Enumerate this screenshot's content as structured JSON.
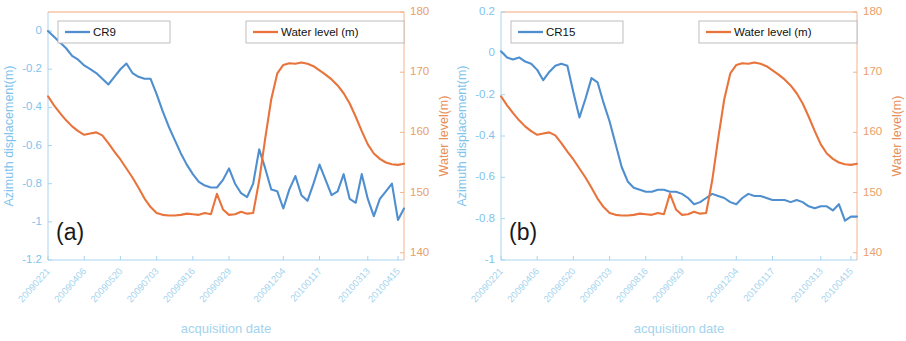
{
  "figure": {
    "width": 906,
    "height": 341,
    "background": "#ffffff",
    "panels": [
      "a",
      "b"
    ]
  },
  "colors": {
    "blue_series": "#4f8fd0",
    "orange_series": "#e8743c",
    "left_axis": "#7fc3ec",
    "right_axis": "#e8905a",
    "xtick": "#a3d3ee",
    "legend_border": "#b7b7b7",
    "panel_tag": "#1a1a1a"
  },
  "chart_data": [
    {
      "type": "line",
      "panel": "a",
      "panel_tag": "(a)",
      "title": "",
      "xlabel": "acquisition date",
      "ylabel": "Azimuth displacement(m)",
      "y2label": "Water level(m)",
      "grid": false,
      "legend_position": "top, two boxes",
      "ylim": [
        -1.2,
        0.1
      ],
      "y2lim": [
        138.8,
        180
      ],
      "yticks": [
        "0",
        "-0.2",
        "-0.4",
        "-0.6",
        "-0.8",
        "-1",
        "-1.2"
      ],
      "ytick_values": [
        0,
        -0.2,
        -0.4,
        -0.6,
        -0.8,
        -1,
        -1.2
      ],
      "y2ticks": [
        "180",
        "170",
        "160",
        "150",
        "140"
      ],
      "y2tick_values": [
        180,
        170,
        160,
        150,
        140
      ],
      "xticks": [
        "20090221",
        "20090406",
        "20090520",
        "20090703",
        "20090816",
        "20090929",
        "20091204",
        "20100117",
        "20100313",
        "20100415"
      ],
      "xtick_positions": [
        0,
        6,
        12,
        18,
        24,
        30,
        39,
        45,
        53,
        58
      ],
      "n_points": 60,
      "series": [
        {
          "name": "CR9",
          "color": "#4f8fd0",
          "axis": "left",
          "values": [
            0.0,
            -0.03,
            -0.06,
            -0.09,
            -0.13,
            -0.15,
            -0.18,
            -0.2,
            -0.22,
            -0.25,
            -0.28,
            -0.24,
            -0.2,
            -0.17,
            -0.22,
            -0.24,
            -0.25,
            -0.25,
            -0.33,
            -0.42,
            -0.5,
            -0.57,
            -0.64,
            -0.7,
            -0.75,
            -0.79,
            -0.81,
            -0.82,
            -0.82,
            -0.78,
            -0.72,
            -0.8,
            -0.85,
            -0.87,
            -0.8,
            -0.62,
            -0.72,
            -0.83,
            -0.84,
            -0.93,
            -0.83,
            -0.76,
            -0.86,
            -0.89,
            -0.8,
            -0.7,
            -0.78,
            -0.86,
            -0.84,
            -0.75,
            -0.88,
            -0.9,
            -0.75,
            -0.88,
            -0.97,
            -0.88,
            -0.84,
            -0.8,
            -0.99,
            -0.93
          ]
        },
        {
          "name": "Water level (m)",
          "color": "#e8743c",
          "axis": "right",
          "values": [
            166.0,
            164.5,
            163.2,
            162.0,
            161.0,
            160.2,
            159.6,
            159.8,
            160.0,
            159.5,
            158.2,
            156.8,
            155.5,
            154.0,
            152.5,
            150.8,
            149.0,
            147.6,
            146.6,
            146.3,
            146.2,
            146.2,
            146.3,
            146.5,
            146.4,
            146.3,
            146.6,
            146.4,
            149.8,
            147.2,
            146.3,
            146.4,
            146.8,
            146.5,
            146.6,
            152.0,
            159.0,
            165.5,
            169.8,
            171.2,
            171.5,
            171.4,
            171.6,
            171.4,
            171.0,
            170.3,
            169.6,
            168.8,
            167.8,
            166.5,
            164.8,
            162.6,
            160.2,
            158.0,
            156.5,
            155.6,
            155.0,
            154.7,
            154.6,
            154.8
          ]
        }
      ],
      "legends": [
        {
          "label": "CR9",
          "color": "#4f8fd0"
        },
        {
          "label": "Water level (m)",
          "color": "#e8743c"
        }
      ]
    },
    {
      "type": "line",
      "panel": "b",
      "panel_tag": "(b)",
      "title": "",
      "xlabel": "acquisition date",
      "ylabel": "Azimuth displacement(m)",
      "y2label": "Water level(m)",
      "grid": false,
      "legend_position": "top, two boxes",
      "ylim": [
        -1.0,
        0.2
      ],
      "y2lim": [
        138.8,
        180
      ],
      "yticks": [
        "0.2",
        "0",
        "-0.2",
        "-0.4",
        "-0.6",
        "-0.8",
        "-1"
      ],
      "ytick_values": [
        0.2,
        0,
        -0.2,
        -0.4,
        -0.6,
        -0.8,
        -1
      ],
      "y2ticks": [
        "180",
        "170",
        "160",
        "150",
        "140"
      ],
      "y2tick_values": [
        180,
        170,
        160,
        150,
        140
      ],
      "xticks": [
        "20090221",
        "20090406",
        "20090520",
        "20090703",
        "20090816",
        "20090929",
        "20091204",
        "20100117",
        "20100313",
        "20100415"
      ],
      "xtick_positions": [
        0,
        6,
        12,
        18,
        24,
        30,
        39,
        45,
        53,
        58
      ],
      "n_points": 60,
      "series": [
        {
          "name": "CR15",
          "color": "#4f8fd0",
          "axis": "left",
          "values": [
            0.01,
            -0.02,
            -0.03,
            -0.02,
            -0.04,
            -0.05,
            -0.08,
            -0.13,
            -0.09,
            -0.06,
            -0.05,
            -0.06,
            -0.19,
            -0.31,
            -0.22,
            -0.12,
            -0.14,
            -0.24,
            -0.33,
            -0.44,
            -0.55,
            -0.62,
            -0.65,
            -0.66,
            -0.67,
            -0.67,
            -0.66,
            -0.66,
            -0.67,
            -0.67,
            -0.68,
            -0.7,
            -0.73,
            -0.72,
            -0.7,
            -0.68,
            -0.69,
            -0.7,
            -0.72,
            -0.73,
            -0.7,
            -0.68,
            -0.69,
            -0.69,
            -0.7,
            -0.71,
            -0.71,
            -0.71,
            -0.72,
            -0.71,
            -0.72,
            -0.74,
            -0.75,
            -0.74,
            -0.74,
            -0.76,
            -0.73,
            -0.81,
            -0.79,
            -0.79
          ]
        },
        {
          "name": "Water level (m)",
          "color": "#e8743c",
          "axis": "right",
          "values": [
            166.0,
            164.5,
            163.2,
            162.0,
            161.0,
            160.2,
            159.6,
            159.8,
            160.0,
            159.5,
            158.2,
            156.8,
            155.5,
            154.0,
            152.5,
            150.8,
            149.0,
            147.6,
            146.6,
            146.3,
            146.2,
            146.2,
            146.3,
            146.5,
            146.4,
            146.3,
            146.6,
            146.4,
            149.8,
            147.2,
            146.3,
            146.4,
            146.8,
            146.5,
            146.6,
            152.0,
            159.0,
            165.5,
            169.8,
            171.2,
            171.5,
            171.4,
            171.6,
            171.4,
            171.0,
            170.3,
            169.6,
            168.8,
            167.8,
            166.5,
            164.8,
            162.6,
            160.2,
            158.0,
            156.5,
            155.6,
            155.0,
            154.7,
            154.6,
            154.8
          ]
        }
      ],
      "legends": [
        {
          "label": "CR15",
          "color": "#4f8fd0"
        },
        {
          "label": "Water level (m)",
          "color": "#e8743c"
        }
      ]
    }
  ]
}
